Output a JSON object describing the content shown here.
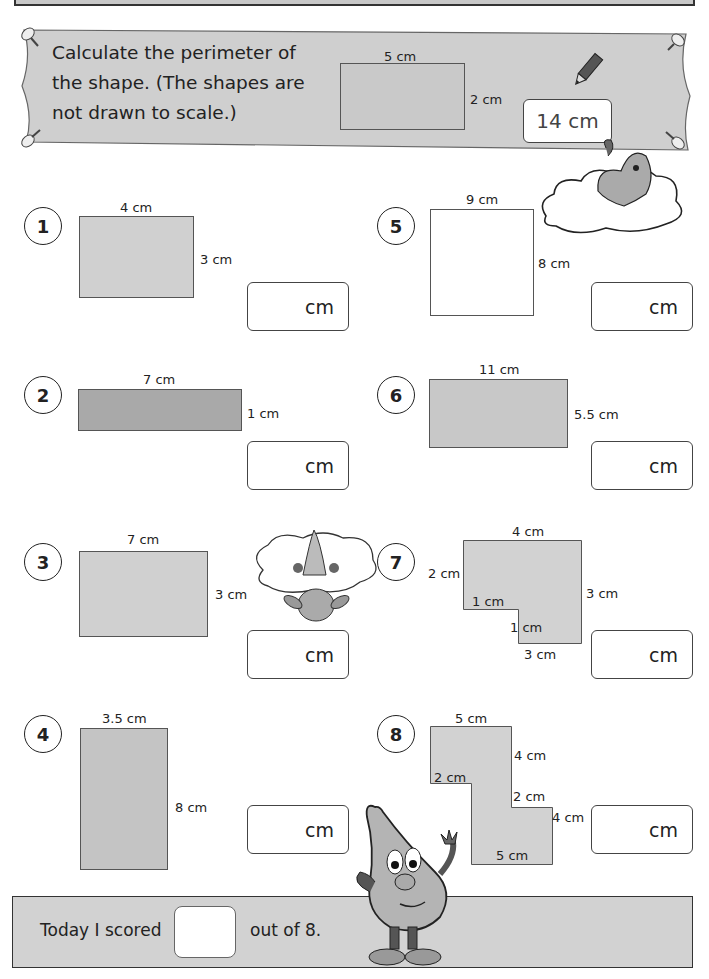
{
  "worksheet": {
    "instruction": {
      "lines": [
        "Calculate the perimeter of",
        "the shape.  (The shapes are",
        "not drawn to scale.)"
      ]
    },
    "example": {
      "width_label": "5 cm",
      "height_label": "2 cm",
      "answer": "14 cm"
    },
    "questions": [
      {
        "number": "1",
        "labels": {
          "top": "4 cm",
          "right": "3 cm"
        },
        "unit": "cm"
      },
      {
        "number": "2",
        "labels": {
          "top": "7 cm",
          "right": "1 cm"
        },
        "unit": "cm"
      },
      {
        "number": "3",
        "labels": {
          "top": "7 cm",
          "right": "3 cm"
        },
        "unit": "cm"
      },
      {
        "number": "4",
        "labels": {
          "top": "3.5 cm",
          "right": "8 cm"
        },
        "unit": "cm"
      },
      {
        "number": "5",
        "labels": {
          "top": "9 cm",
          "right": "8 cm"
        },
        "unit": "cm"
      },
      {
        "number": "6",
        "labels": {
          "top": "11 cm",
          "right": "5.5 cm"
        },
        "unit": "cm"
      },
      {
        "number": "7",
        "labels": {
          "top": "4 cm",
          "left": "2 cm",
          "step_top": "1 cm",
          "step_side": "1 cm",
          "right": "3 cm",
          "bottom": "3 cm"
        },
        "unit": "cm"
      },
      {
        "number": "8",
        "labels": {
          "top": "5 cm",
          "upper_right": "4 cm",
          "left_step": "2 cm",
          "right_step": "2 cm",
          "lower_right": "4 cm",
          "bottom": "5 cm"
        },
        "unit": "cm"
      }
    ],
    "footer": {
      "prefix": "Today I scored",
      "suffix": "out of 8."
    }
  }
}
